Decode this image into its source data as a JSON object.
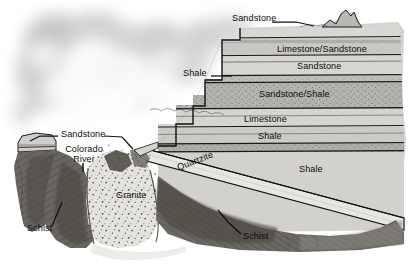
{
  "figure": {
    "kind": "geologic-cross-section",
    "background_color": "#ffffff"
  },
  "palette": {
    "sky_grey": "#c9c9c9",
    "cloud_white": "#f4f4f4",
    "strata_light": "#d5d4d2",
    "strata_mid": "#c2c1be",
    "strata_dark": "#a9a8a4",
    "granite_light": "#e2e1dd",
    "schist_dark": "#6e6b66",
    "schist_darker": "#4f4c48",
    "quartzite_band": "#e6e5e1",
    "line_black": "#121212",
    "label_black": "#0d0d0d"
  },
  "labels": [
    {
      "id": "sandstone-top",
      "text": "Sandstone",
      "x": 232,
      "y": 18,
      "size": "md"
    },
    {
      "id": "limestone-sandstone",
      "text": "Limestone/Sandstone",
      "x": 277,
      "y": 50,
      "size": "md"
    },
    {
      "id": "sandstone-upper",
      "text": "Sandstone",
      "x": 297,
      "y": 67,
      "size": "md"
    },
    {
      "id": "shale-step",
      "text": "Shale",
      "x": 186,
      "y": 73,
      "size": "md"
    },
    {
      "id": "sandstone-shale",
      "text": "Sandstone/Shale",
      "x": 259,
      "y": 95,
      "size": "md"
    },
    {
      "id": "limestone",
      "text": "Limestone",
      "x": 244,
      "y": 120,
      "size": "md"
    },
    {
      "id": "shale-mid",
      "text": "Shale",
      "x": 258,
      "y": 137,
      "size": "md"
    },
    {
      "id": "shale-right",
      "text": "Shale",
      "x": 299,
      "y": 170,
      "size": "md"
    },
    {
      "id": "sandstone-left",
      "text": "Sandstone",
      "x": 61,
      "y": 132,
      "size": "md"
    },
    {
      "id": "schist-left",
      "text": "Schist",
      "x": 27,
      "y": 228,
      "size": "md"
    },
    {
      "id": "schist-right",
      "text": "Schist",
      "x": 243,
      "y": 236,
      "size": "md"
    },
    {
      "id": "granite",
      "text": "Granite",
      "x": 118,
      "y": 195,
      "size": "md"
    }
  ],
  "stacked_labels": [
    {
      "id": "colorado-river",
      "line1": "Colorado",
      "line2": "River",
      "x": 62,
      "y": 150,
      "size": "md"
    }
  ],
  "rotated_labels": [
    {
      "id": "quartzite",
      "text": "Quartzite",
      "x": 183,
      "y": 170,
      "rotate": -21,
      "size": "md"
    }
  ],
  "rock_units": [
    "Sandstone",
    "Limestone/Sandstone",
    "Sandstone",
    "Shale",
    "Sandstone/Shale",
    "Limestone",
    "Shale",
    "Quartzite",
    "Granite",
    "Schist"
  ],
  "features": [
    "Colorado River"
  ]
}
